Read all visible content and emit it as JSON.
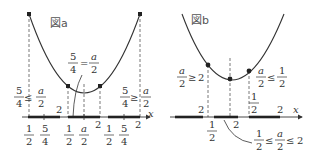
{
  "figure_a": {
    "title": "図a",
    "top_label": {
      "num": "5",
      "den": "4",
      "eq": "=",
      "rnum": "a",
      "rden": "2"
    },
    "left_label": {
      "num": "5",
      "den": "4",
      "rel": "≤",
      "rnum": "a",
      "rden": "2"
    },
    "right_label": {
      "num": "5",
      "den": "4",
      "rel": "≥",
      "rnum": "a",
      "rden": "2"
    },
    "axis_var": "x",
    "segments": [
      {
        "ticks": [
          {
            "num": "1",
            "den": "2"
          },
          {
            "num": "5",
            "den": "4"
          }
        ],
        "end": "2"
      },
      {
        "ticks": [
          {
            "num": "1",
            "den": "2"
          },
          {
            "num": "a",
            "den": "2"
          }
        ],
        "end": "2"
      },
      {
        "ticks": [
          {
            "num": "1",
            "den": "2"
          },
          {
            "num": "5",
            "den": "4"
          }
        ],
        "end": "2"
      }
    ]
  },
  "figure_b": {
    "title": "図b",
    "left_label": {
      "num": "a",
      "den": "2",
      "rel": "≥",
      "rhs": "2"
    },
    "right_label": {
      "num": "a",
      "den": "2",
      "rel": "≤",
      "rnum": "1",
      "rden": "2"
    },
    "bottom_label": {
      "lnum": "1",
      "lden": "2",
      "rel1": "≤",
      "num": "a",
      "den": "2",
      "rel2": "≤",
      "rhs": "2"
    },
    "axis_var": "x",
    "tick_labels": {
      "seg1_end": "2",
      "seg2_start_num": "1",
      "seg2_start_den": "2",
      "seg2_end": "2",
      "seg3_start_num": "1",
      "seg3_start_den": "2",
      "seg3_end": "2"
    }
  }
}
